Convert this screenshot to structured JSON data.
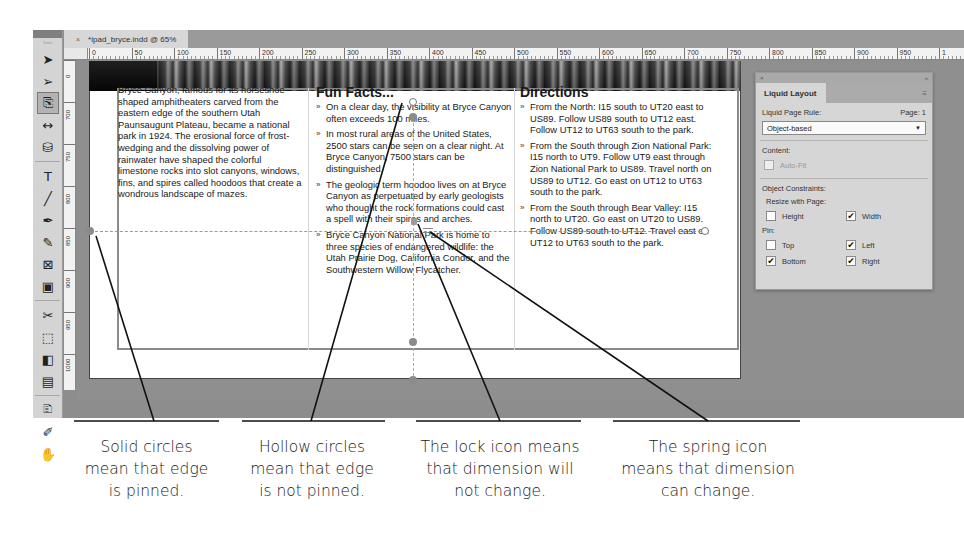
{
  "window": {
    "tab_title": "*ipad_bryce.indd @ 65%",
    "tab_close": "×"
  },
  "toolbox": {
    "grip_label": "Tools",
    "tools": [
      {
        "name": "selection-tool",
        "glyph": "➤"
      },
      {
        "name": "direct-selection-tool",
        "glyph": "➢"
      },
      {
        "name": "page-tool",
        "glyph": "⎘"
      },
      {
        "name": "gap-tool",
        "glyph": "↔"
      },
      {
        "name": "content-collector-tool",
        "glyph": "⛁"
      },
      {
        "name": "type-tool",
        "glyph": "T"
      },
      {
        "name": "line-tool",
        "glyph": "╱"
      },
      {
        "name": "pen-tool",
        "glyph": "✒"
      },
      {
        "name": "pencil-tool",
        "glyph": "✎"
      },
      {
        "name": "rectangle-frame-tool",
        "glyph": "⊠"
      },
      {
        "name": "rectangle-tool",
        "glyph": "▣"
      },
      {
        "name": "scissors-tool",
        "glyph": "✂"
      },
      {
        "name": "free-transform-tool",
        "glyph": "⬚"
      },
      {
        "name": "gradient-swatch-tool",
        "glyph": "◧"
      },
      {
        "name": "gradient-feather-tool",
        "glyph": "▤"
      },
      {
        "name": "note-tool",
        "glyph": "🗈"
      },
      {
        "name": "eyedropper-tool",
        "glyph": "✐"
      },
      {
        "name": "hand-tool",
        "glyph": "✋"
      }
    ]
  },
  "rulers": {
    "horizontal": [
      "0",
      "50",
      "100",
      "150",
      "200",
      "250",
      "300",
      "350",
      "400",
      "450",
      "500",
      "550",
      "600",
      "650",
      "700",
      "750",
      "800",
      "850",
      "900",
      "950",
      "1"
    ],
    "vertical": [
      "0",
      "700",
      "750",
      "800",
      "850",
      "900",
      "950",
      "1000"
    ]
  },
  "document": {
    "column1": {
      "body": "Bryce Canyon, famous for its horseshoe-shaped amphitheaters carved from the eastern edge of the southern Utah Paunsaugunt Plateau, became a national park in 1924. The erosional force of frost-wedging and the dissolving power of rainwater have shaped the colorful limestone rocks into slot canyons, windows, fins, and spires called hoodoos that create a wondrous landscape of mazes."
    },
    "column2": {
      "heading": "Fun Facts...",
      "items": [
        "On a clear day, the visibility at Bryce Canyon often exceeds 100 miles.",
        "In most rural areas of the United States, 2500 stars can be seen on a clear night. At Bryce Canyon, 7500 stars can be distinguished.",
        "The geologic term hoodoo lives on at Bryce Canyon as perpetuated by early geologists who thought the rock formations could cast a spell with their spires and arches.",
        "Bryce Canyon National Park is home to three species of endangered wildlife: the Utah Prairie Dog, California Condor, and the Southwestern Willow Flycatcher."
      ]
    },
    "column3": {
      "heading": "Directions",
      "items": [
        "From the North: I15 south to UT20 east to US89. Follow US89 south to UT12 east. Follow UT12 to UT63 south to the park.",
        "From the South through Zion National Park: I15 north to UT9. Follow UT9 east through Zion National Park to US89. Travel north on US89 to UT12. Go east on UT12 to UT63 south to the park.",
        "From the South through Bear Valley: I15 north to UT20. Go east on UT20 to US89. Follow US89 south to UT12. Travel east on UT12 to UT63 south to the park."
      ]
    }
  },
  "panel": {
    "title_close": "×",
    "title_collapse": "»",
    "tab_label": "Liquid Layout",
    "menu_icon": "≡",
    "rule_label": "Liquid Page Rule:",
    "page_label": "Page: 1",
    "rule_value": "Object-based",
    "content_label": "Content:",
    "autofit_label": "Auto-Fit",
    "constraints_label": "Object Constraints:",
    "resize_label": "Resize with Page:",
    "height_label": "Height",
    "width_label": "Width",
    "pin_label": "Pin:",
    "top_label": "Top",
    "left_label": "Left",
    "bottom_label": "Bottom",
    "right_label": "Right",
    "checkmark": "✔",
    "states": {
      "autofit": false,
      "height": false,
      "width": true,
      "top": false,
      "left": true,
      "bottom": true,
      "right": true
    }
  },
  "callouts": [
    {
      "line1": "Solid circles",
      "line2": "mean that edge",
      "line3": "is pinned."
    },
    {
      "line1": "Hollow circles",
      "line2": "mean that edge",
      "line3": "is not pinned."
    },
    {
      "line1": "The lock icon means",
      "line2": "that dimension will",
      "line3": "not change."
    },
    {
      "line1": "The spring icon",
      "line2": "means that dimension",
      "line3": "can change."
    }
  ]
}
